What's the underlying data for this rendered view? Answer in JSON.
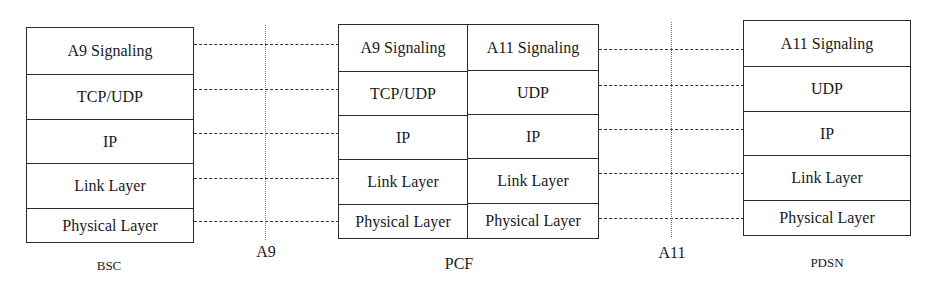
{
  "diagram": {
    "type": "protocol-stack",
    "nodes": [
      {
        "name": "BSC",
        "layers": [
          "A9 Signaling",
          "TCP/UDP",
          "IP",
          "Link Layer",
          "Physical Layer"
        ]
      },
      {
        "name": "PCF",
        "left_layers": [
          "A9 Signaling",
          "TCP/UDP",
          "IP",
          "Link Layer",
          "Physical Layer"
        ],
        "right_layers": [
          "A11 Signaling",
          "UDP",
          "IP",
          "Link Layer",
          "Physical Layer"
        ]
      },
      {
        "name": "PDSN",
        "layers": [
          "A11 Signaling",
          "UDP",
          "IP",
          "Link Layer",
          "Physical Layer"
        ]
      }
    ],
    "interfaces": [
      {
        "name": "A9",
        "between": [
          "BSC",
          "PCF"
        ]
      },
      {
        "name": "A11",
        "between": [
          "PCF",
          "PDSN"
        ]
      }
    ]
  }
}
